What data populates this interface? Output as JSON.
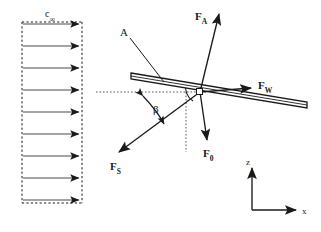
{
  "figure": {
    "type": "free-body-diagram",
    "background_color": "#ffffff",
    "line_color": "#1a1a1a"
  },
  "flow_profile": {
    "label": "c",
    "label_subscript": "∞",
    "box": {
      "x": 22,
      "y": 22,
      "width": 60,
      "height": 181,
      "style": "dashed"
    },
    "arrow_count": 9,
    "arrow_direction": "right",
    "profile_shape": "uniform",
    "arrow_rows_y": [
      24,
      46,
      68,
      90,
      112,
      134,
      156,
      178,
      200
    ]
  },
  "plate": {
    "label": "A",
    "label_x": 120,
    "label_y": 27,
    "leader_from": {
      "x": 131,
      "y": 40
    },
    "leader_to": {
      "x": 163,
      "y": 81
    },
    "left_tip": {
      "x": 131,
      "y": 76
    },
    "right_tip": {
      "x": 307,
      "y": 105
    },
    "thickness": 5,
    "fill": "#ffffff",
    "stroke": "#1a1a1a"
  },
  "pivot": {
    "x": 200,
    "y": 92,
    "marker": "small-white-square"
  },
  "forces": [
    {
      "name": "F_A",
      "label": "F",
      "subscript": "A",
      "direction": "up",
      "from": {
        "x": 200,
        "y": 92
      },
      "to": {
        "x": 219,
        "y": 14
      },
      "label_x": 195,
      "label_y": 11
    },
    {
      "name": "F_W",
      "label": "F",
      "subscript": "W",
      "direction": "right",
      "from": {
        "x": 200,
        "y": 92
      },
      "to": {
        "x": 254,
        "y": 88
      },
      "label_x": 258,
      "label_y": 80
    },
    {
      "name": "F_0",
      "label": "F",
      "subscript": "0",
      "direction": "down",
      "from": {
        "x": 200,
        "y": 92
      },
      "to": {
        "x": 208,
        "y": 142
      },
      "label_x": 203,
      "label_y": 148
    },
    {
      "name": "F_S",
      "label": "F",
      "subscript": "S",
      "direction": "down-left",
      "from": {
        "x": 200,
        "y": 92
      },
      "to": {
        "x": 117,
        "y": 153
      },
      "label_x": 110,
      "label_y": 161
    }
  ],
  "angle": {
    "label": "β",
    "label_x": 153,
    "label_y": 104,
    "vertex": {
      "x": 200,
      "y": 92
    },
    "between": [
      "horizontal-reference-line",
      "F_S"
    ],
    "marker": "double-headed-curved-arrow"
  },
  "reference_lines": [
    {
      "name": "horizontal-dotted",
      "x1": 96,
      "y1": 92,
      "x2": 206,
      "y2": 92,
      "style": "dotted"
    },
    {
      "name": "vertical-dotted",
      "x1": 186,
      "y1": 92,
      "x2": 186,
      "y2": 152,
      "style": "dotted"
    }
  ],
  "axes": {
    "origin": {
      "x": 252,
      "y": 210
    },
    "z": {
      "label": "z",
      "direction": "up",
      "length": 44,
      "label_x": 246,
      "label_y": 158
    },
    "x": {
      "label": "x",
      "direction": "right",
      "length": 45,
      "label_x": 302,
      "label_y": 207
    }
  }
}
